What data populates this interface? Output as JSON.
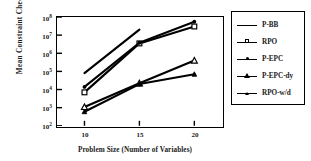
{
  "chart_data": {
    "type": "line",
    "title": "",
    "xlabel": "Problem Size (Number of Variables)",
    "ylabel": "Mean  Constraint  Checks",
    "x": [
      10,
      15,
      20
    ],
    "xtick_labels": [
      "10",
      "15",
      "20"
    ],
    "xlim": [
      7.5,
      22.5
    ],
    "yscale": "log",
    "ylim": [
      100,
      100000000
    ],
    "ytick_labels": [
      "10",
      "10",
      "10",
      "10",
      "10",
      "10",
      "10"
    ],
    "ytick_exponents": [
      "2",
      "3",
      "4",
      "5",
      "6",
      "7",
      "8"
    ],
    "ytick_values": [
      100,
      1000,
      10000,
      100000,
      1000000,
      10000000,
      100000000
    ],
    "grid": false,
    "legend_position": "right-outside",
    "series": [
      {
        "name": "P-BB",
        "marker": "none",
        "x": [
          10,
          15
        ],
        "values": [
          80000,
          20000000
        ]
      },
      {
        "name": "RPO",
        "marker": "square",
        "x": [
          10,
          15,
          20
        ],
        "values": [
          7000,
          3500000,
          30000000
        ]
      },
      {
        "name": "P-EPC",
        "marker": "dot",
        "x": [
          10,
          15,
          20
        ],
        "values": [
          14000,
          3800000,
          55000000
        ]
      },
      {
        "name": "P-EPC-dy",
        "marker": "triangle",
        "x": [
          10,
          15,
          20
        ],
        "values": [
          1100,
          22000,
          400000
        ]
      },
      {
        "name": "RPO-w/d",
        "marker": "triangle-small",
        "x": [
          10,
          15,
          20
        ],
        "values": [
          600,
          20000,
          70000
        ]
      }
    ]
  },
  "legend": {
    "items": [
      {
        "label": "P-BB"
      },
      {
        "label": "RPO"
      },
      {
        "label": "P-EPC"
      },
      {
        "label": "P-EPC-dy"
      },
      {
        "label": "RPO-w/d"
      }
    ]
  }
}
